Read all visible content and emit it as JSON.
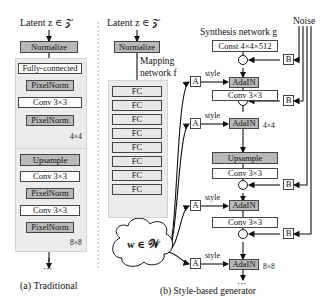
{
  "top_cropped_text": "",
  "traditional": {
    "latent_label": "Latent  z ∈ 𝒵",
    "normalize": "Normalize",
    "block1": {
      "items": [
        "Fully-connected",
        "PixelNorm",
        "Conv 3×3",
        "PixelNorm"
      ],
      "resolution": "4×4"
    },
    "block2": {
      "items": [
        "Upsample",
        "Conv 3×3",
        "PixelNorm",
        "Conv 3×3",
        "PixelNorm"
      ],
      "resolution": "8×8"
    },
    "ellipsis": "···",
    "caption": "(a) Traditional"
  },
  "style_based": {
    "latent_label": "Latent  z ∈ 𝒵",
    "normalize": "Normalize",
    "mapping_label_line1": "Mapping",
    "mapping_label_line2": "network f",
    "fc_layers": [
      "FC",
      "FC",
      "FC",
      "FC",
      "FC",
      "FC",
      "FC",
      "FC"
    ],
    "w_label": "w ∈ 𝒲",
    "synthesis_label": "Synthesis network g",
    "noise_label": "Noise",
    "affine_label": "A",
    "noise_scale_label": "B",
    "style_label": "style",
    "add_symbol": "+",
    "block1": {
      "const": "Const 4×4×512",
      "adain": "AdaIN",
      "conv": "Conv 3×3",
      "resolution": "4×4"
    },
    "block2": {
      "upsample": "Upsample",
      "conv": "Conv 3×3",
      "adain": "AdaIN",
      "resolution": "8×8"
    },
    "ellipsis": "···",
    "caption": "(b) Style-based generator"
  }
}
